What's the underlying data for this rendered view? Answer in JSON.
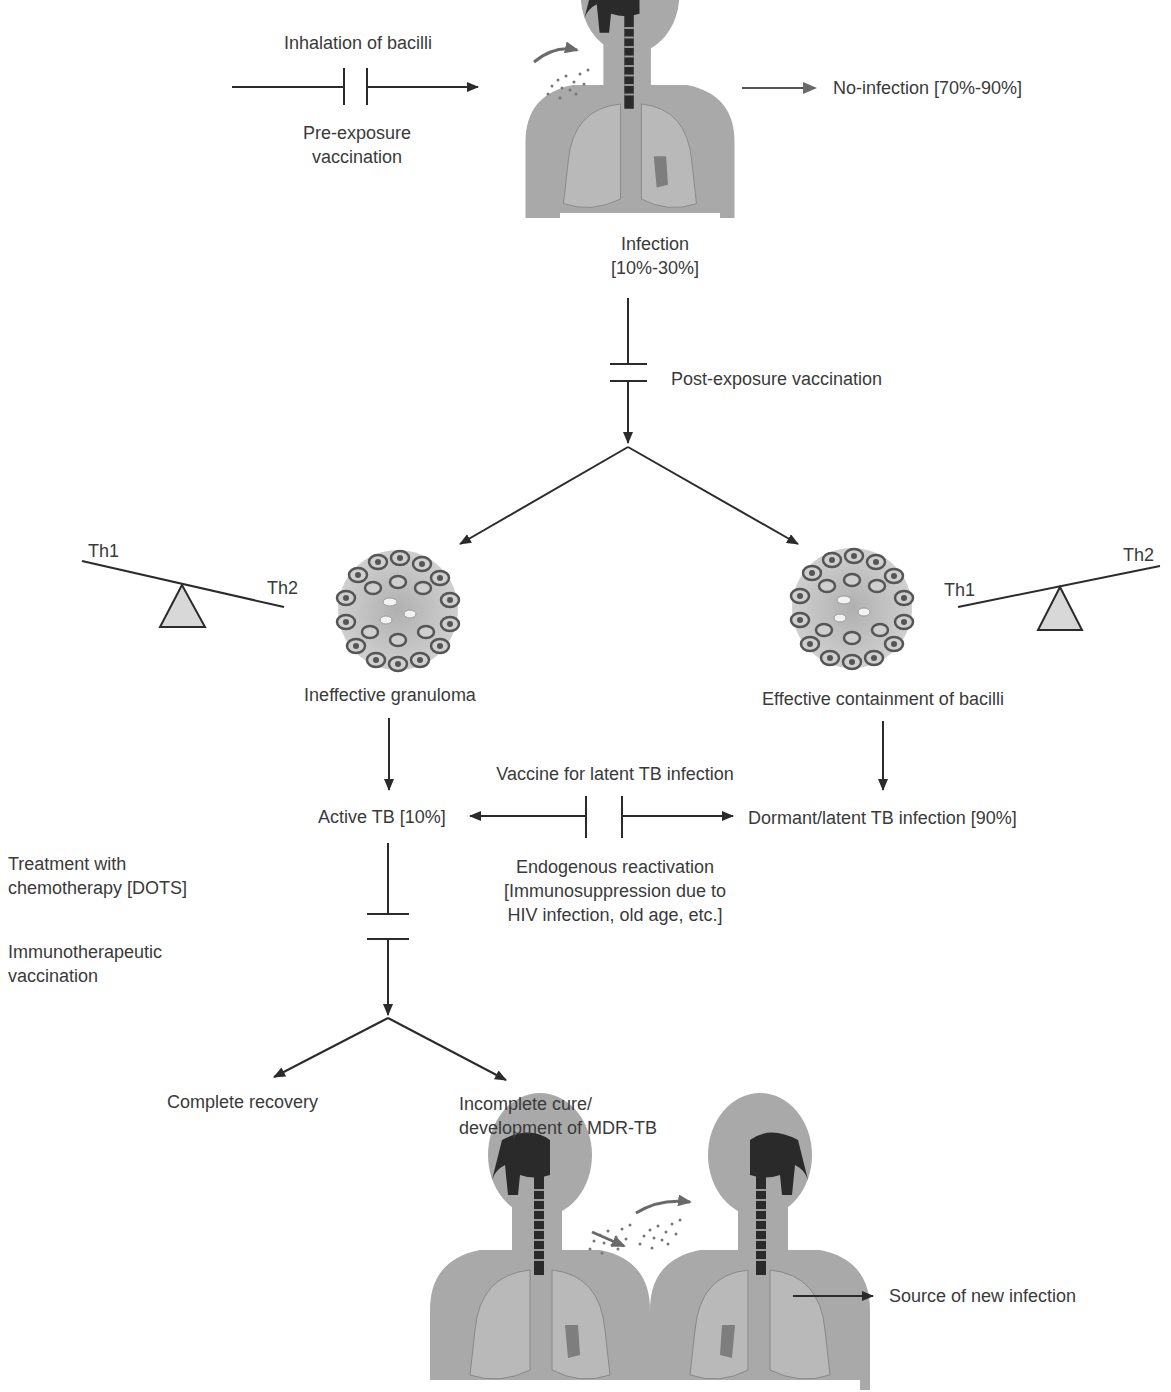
{
  "diagram": {
    "type": "flowchart",
    "topic": "Tuberculosis infection course and vaccination intervention points",
    "labels": {
      "inhalation": "Inhalation of bacilli",
      "pre_exposure_1": "Pre-exposure",
      "pre_exposure_2": "vaccination",
      "no_infection": "No-infection [70%-90%]",
      "infection_1": "Infection",
      "infection_2": "[10%-30%]",
      "post_exposure": "Post-exposure vaccination",
      "th1_left": "Th1",
      "th2_left": "Th2",
      "th1_right": "Th1",
      "th2_right": "Th2",
      "ineffective_granuloma": "Ineffective granuloma",
      "effective_containment": "Effective containment of bacilli",
      "vaccine_latent": "Vaccine for latent TB infection",
      "active_tb": "Active TB [10%]",
      "dormant_latent": "Dormant/latent TB infection [90%]",
      "endogenous_1": "Endogenous reactivation",
      "endogenous_2": "[Immunosuppression due to",
      "endogenous_3": "HIV infection, old age, etc.]",
      "treatment_1": "Treatment with",
      "treatment_2": "chemotherapy [DOTS]",
      "immuno_1": "Immunotherapeutic",
      "immuno_2": "vaccination",
      "complete_recovery": "Complete recovery",
      "incomplete_1": "Incomplete cure/",
      "incomplete_2": "development of MDR-TB",
      "source_new": "Source of new infection"
    },
    "colors": {
      "line": "#2b2b2b",
      "text": "#3a3a3a",
      "body": "#a9a9a9",
      "body_dark": "#8e8e8e",
      "airway": "#2a2a2a",
      "triangle": "#d8d8d8"
    }
  }
}
